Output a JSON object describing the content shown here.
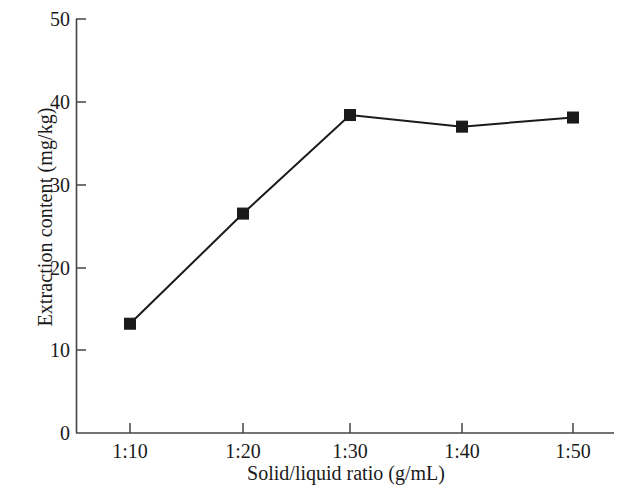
{
  "chart_data": {
    "type": "line",
    "title": "",
    "xlabel": "Solid/liquid ratio (g/mL)",
    "ylabel": "Extraction content (mg/kg)",
    "categories": [
      "1:10",
      "1:20",
      "1:30",
      "1:40",
      "1:50"
    ],
    "values": [
      13.2,
      26.5,
      38.4,
      37.0,
      38.1
    ],
    "series": [
      {
        "name": "Extraction content",
        "values": [
          13.2,
          26.5,
          38.4,
          37.0,
          38.1
        ]
      }
    ],
    "ylim": [
      0,
      50
    ],
    "yticks": [
      0,
      10,
      20,
      30,
      40,
      50
    ],
    "ytick_labels": [
      "0",
      "10",
      "20",
      "30",
      "40",
      "50"
    ],
    "xtick_labels": [
      "1:10",
      "1:20",
      "1:30",
      "1:40",
      "1:50"
    ],
    "grid": false,
    "legend": "none",
    "marker": "square",
    "marker_color": "#1a1a1a",
    "line_color": "#1a1a1a",
    "axis_color": "#444444",
    "background": "#ffffff",
    "spines": [
      "left",
      "bottom"
    ]
  }
}
